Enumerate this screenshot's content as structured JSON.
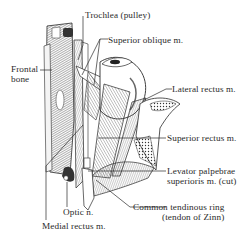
{
  "diagram": {
    "colors": {
      "ink": "#2a2a2a",
      "background": "#ffffff",
      "shade": "#9a9a9a"
    },
    "labels": [
      {
        "id": "trochlea",
        "text": "Trochlea (pulley)"
      },
      {
        "id": "superior-oblique",
        "text": "Superior oblique m."
      },
      {
        "id": "frontal-bone-1",
        "text": "Frontal"
      },
      {
        "id": "frontal-bone-2",
        "text": "bone"
      },
      {
        "id": "lateral-rectus",
        "text": "Lateral rectus m."
      },
      {
        "id": "superior-rectus",
        "text": "Superior rectus m."
      },
      {
        "id": "levator-1",
        "text": "Levator palpebrae"
      },
      {
        "id": "levator-2",
        "text": "superioris m. (cut)"
      },
      {
        "id": "optic-nerve",
        "text": "Optic n."
      },
      {
        "id": "common-ring-1",
        "text": "Common tendinous ring"
      },
      {
        "id": "common-ring-2",
        "text": "(tendon of Zinn)"
      },
      {
        "id": "medial-rectus",
        "text": "Medial rectus m."
      }
    ]
  }
}
